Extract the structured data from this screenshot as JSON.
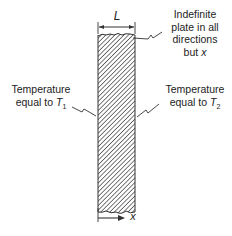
{
  "diagram": {
    "dimension_label": "L",
    "axis_label": "x",
    "plate_note": {
      "line1": "Indefinite",
      "line2": "plate in all",
      "line3": "directions",
      "line4_prefix": "but ",
      "line4_var": "x"
    },
    "left_boundary": {
      "line1": "Temperature",
      "line2_prefix": "equal to ",
      "var": "T",
      "sub": "1"
    },
    "right_boundary": {
      "line1": "Temperature",
      "line2_prefix": "equal to ",
      "var": "T",
      "sub": "2"
    }
  }
}
